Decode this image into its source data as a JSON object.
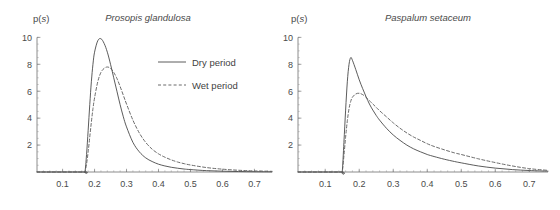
{
  "figure": {
    "background_color": "#ffffff",
    "line_color": "#4a4a4a",
    "text_color": "#4a4a4a",
    "panel_count": 2
  },
  "panels": [
    {
      "id": "prosopis-glandulosa",
      "title": "Prosopis glandulosa",
      "ylabel_prefix": "p(",
      "ylabel_italic": "s",
      "ylabel_suffix": ")",
      "has_legend": true
    },
    {
      "id": "paspalum-setaceum",
      "title": "Paspalum setaceum",
      "ylabel_prefix": "p(",
      "ylabel_italic": "s",
      "ylabel_suffix": ")",
      "has_legend": false
    }
  ],
  "legend": {
    "position": "upper-right-of-left-panel",
    "entries": [
      {
        "label": "Dry period",
        "style": "solid"
      },
      {
        "label": "Wet period",
        "style": "dashed"
      }
    ]
  },
  "axes": {
    "x_ticks": [
      "0.1",
      "0.2",
      "0.3",
      "0.4",
      "0.5",
      "0.6",
      "0.7"
    ],
    "y_ticks": [
      "2",
      "4",
      "6",
      "8",
      "10"
    ],
    "xlim": [
      0.02,
      0.755
    ],
    "ylim": [
      0,
      10.4
    ],
    "grid": false
  },
  "chart_data": [
    {
      "type": "line",
      "title": "Prosopis glandulosa",
      "xlabel": "s",
      "ylabel": "p(s)",
      "xlim": [
        0.02,
        0.755
      ],
      "ylim": [
        0,
        10.4
      ],
      "x_ticks": [
        0.1,
        0.2,
        0.3,
        0.4,
        0.5,
        0.6,
        0.7
      ],
      "y_ticks": [
        2,
        4,
        6,
        8,
        10
      ],
      "grid": false,
      "legend_position": "upper right",
      "x": [
        0.17,
        0.175,
        0.18,
        0.185,
        0.19,
        0.195,
        0.2,
        0.21,
        0.22,
        0.23,
        0.24,
        0.25,
        0.26,
        0.27,
        0.28,
        0.29,
        0.3,
        0.32,
        0.34,
        0.36,
        0.38,
        0.4,
        0.42,
        0.44,
        0.46,
        0.48,
        0.5,
        0.55,
        0.6,
        0.65,
        0.7,
        0.755
      ],
      "series": [
        {
          "name": "Dry period",
          "style": "solid",
          "peak_x": 0.222,
          "peak_y": 9.9,
          "values": [
            0.0,
            1.3,
            3.1,
            5.0,
            6.7,
            8.0,
            8.9,
            9.75,
            9.9,
            9.55,
            8.9,
            8.0,
            7.0,
            6.0,
            5.0,
            4.1,
            3.35,
            2.2,
            1.5,
            1.05,
            0.78,
            0.58,
            0.45,
            0.35,
            0.28,
            0.22,
            0.18,
            0.1,
            0.06,
            0.035,
            0.02,
            0.012
          ]
        },
        {
          "name": "Wet period",
          "style": "dashed",
          "peak_x": 0.245,
          "peak_y": 7.8,
          "values": [
            0.0,
            0.6,
            1.5,
            2.6,
            3.7,
            4.7,
            5.5,
            6.7,
            7.4,
            7.7,
            7.8,
            7.7,
            7.4,
            6.95,
            6.35,
            5.7,
            5.05,
            3.85,
            2.9,
            2.2,
            1.7,
            1.35,
            1.1,
            0.9,
            0.74,
            0.62,
            0.52,
            0.33,
            0.21,
            0.13,
            0.08,
            0.05
          ]
        }
      ]
    },
    {
      "type": "line",
      "title": "Paspalum setaceum",
      "xlabel": "s",
      "ylabel": "p(s)",
      "xlim": [
        0.02,
        0.755
      ],
      "ylim": [
        0,
        10.4
      ],
      "x_ticks": [
        0.1,
        0.2,
        0.3,
        0.4,
        0.5,
        0.6,
        0.7
      ],
      "y_ticks": [
        2,
        4,
        6,
        8,
        10
      ],
      "grid": false,
      "legend_position": "none",
      "x": [
        0.15,
        0.155,
        0.16,
        0.165,
        0.17,
        0.175,
        0.18,
        0.19,
        0.2,
        0.21,
        0.22,
        0.23,
        0.24,
        0.25,
        0.26,
        0.28,
        0.3,
        0.32,
        0.34,
        0.36,
        0.38,
        0.4,
        0.42,
        0.45,
        0.48,
        0.5,
        0.55,
        0.6,
        0.65,
        0.7,
        0.755
      ],
      "series": [
        {
          "name": "Dry period",
          "style": "solid",
          "peak_x": 0.176,
          "peak_y": 8.5,
          "values": [
            0.0,
            2.2,
            4.6,
            6.7,
            8.0,
            8.5,
            8.3,
            7.6,
            6.85,
            6.2,
            5.6,
            5.05,
            4.6,
            4.2,
            3.85,
            3.25,
            2.75,
            2.35,
            2.0,
            1.72,
            1.5,
            1.3,
            1.15,
            0.95,
            0.78,
            0.68,
            0.45,
            0.29,
            0.18,
            0.11,
            0.06
          ]
        },
        {
          "name": "Wet period",
          "style": "dashed",
          "peak_x": 0.196,
          "peak_y": 5.85,
          "values": [
            0.0,
            1.2,
            2.6,
            3.8,
            4.7,
            5.25,
            5.55,
            5.8,
            5.85,
            5.75,
            5.55,
            5.3,
            5.05,
            4.8,
            4.55,
            4.1,
            3.65,
            3.25,
            2.9,
            2.6,
            2.35,
            2.1,
            1.9,
            1.65,
            1.42,
            1.3,
            0.98,
            0.7,
            0.45,
            0.25,
            0.12
          ]
        }
      ]
    }
  ]
}
